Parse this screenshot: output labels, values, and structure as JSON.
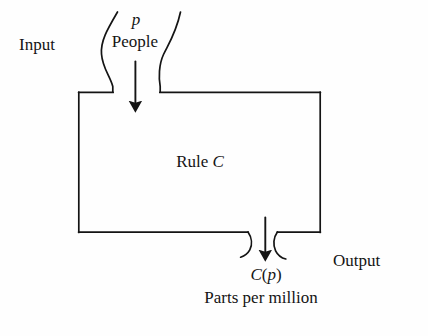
{
  "diagram": {
    "type": "function-machine",
    "stroke_color": "#141414",
    "background_color": "#fefefe",
    "box": {
      "label_prefix": "Rule",
      "label_variable": "C",
      "x": 78,
      "y": 92,
      "width": 242,
      "height": 140
    },
    "input": {
      "side_label": "Input",
      "variable": "p",
      "units": "People",
      "arrow": {
        "x": 135,
        "y_start": 62,
        "y_end": 113,
        "direction": "down"
      }
    },
    "output": {
      "side_label": "Output",
      "variable": "C(p)",
      "variable_parts": {
        "function": "C",
        "open_paren": "(",
        "argument": "p",
        "close_paren": ")"
      },
      "units": "Parts per million",
      "arrow": {
        "x": 265,
        "y_start": 218,
        "y_end": 262,
        "direction": "down"
      }
    },
    "funnels": {
      "top": {
        "left_gap_x": 113,
        "right_gap_x": 160,
        "mouth_left_x": 117,
        "mouth_right_x": 180,
        "mouth_y": 12
      },
      "bottom": {
        "left_gap_x": 248,
        "right_gap_x": 277,
        "spout_bottom_y": 258
      }
    }
  }
}
